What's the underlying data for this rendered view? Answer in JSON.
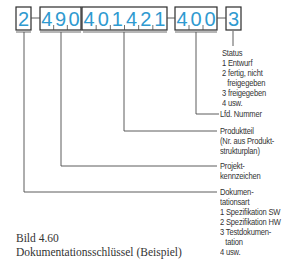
{
  "code": {
    "groups": [
      {
        "id": "dokumentationsart",
        "digits": [
          "2"
        ]
      },
      {
        "id": "projektkennzeichen",
        "digits": [
          "4",
          "9",
          "0"
        ]
      },
      {
        "id": "produktteil",
        "digits": [
          "4",
          "0",
          "1",
          "4",
          "2",
          "1"
        ]
      },
      {
        "id": "lfd-nummer",
        "digits": [
          "4",
          "0",
          "0"
        ]
      },
      {
        "id": "status",
        "digits": [
          "3"
        ]
      }
    ],
    "separator": "-"
  },
  "labels": {
    "status": {
      "title": "Status",
      "items": [
        "1 Entwurf",
        "2 fertig, nicht",
        "freigegeben",
        "3 freigegeben",
        "4 usw."
      ]
    },
    "lfd_nummer": {
      "title": "Lfd. Nummer"
    },
    "produktteil": {
      "lines": [
        "Produktteil",
        "(Nr. aus Produkt-",
        "strukturplan)"
      ]
    },
    "projektkennzeichen": {
      "lines": [
        "Projekt-",
        "kennzeichen"
      ]
    },
    "dokumentationsart": {
      "lines": [
        "Dokumen-",
        "tationsart"
      ],
      "items": [
        "1 Spezifikation SW",
        "2 Spezifikation HW",
        "3 Testdokumen-",
        "tation",
        "4 usw."
      ]
    }
  },
  "caption": {
    "figure": "Bild 4.60",
    "title": "Dokumentationsschlüssel (Beispiel)"
  },
  "colors": {
    "digits": "#2f9ad0",
    "lines": "#4a4a4a",
    "text": "#333333"
  }
}
